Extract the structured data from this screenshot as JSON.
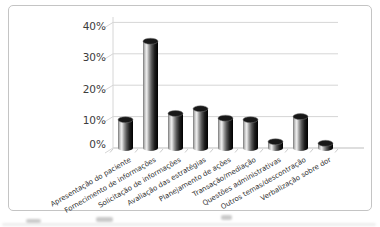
{
  "chart_data": {
    "type": "bar",
    "subtype": "3d-cylinder",
    "title": "",
    "xlabel": "",
    "ylabel": "",
    "categories": [
      "Apresentação do paciente",
      "Fornecimento de informações",
      "Solicitação de informações",
      "Avaliação das estratégias",
      "Planejamento de ações",
      "Transação/mediação",
      "Questões administrativas",
      "Outros temas/descontração",
      "Verbalização sobre dor"
    ],
    "values": [
      9,
      34,
      11,
      12.5,
      9.5,
      9,
      2,
      10,
      1.5
    ],
    "y_ticks": [
      "0%",
      "10%",
      "20%",
      "30%",
      "40%"
    ],
    "ylim": [
      0,
      40
    ],
    "grid": true,
    "legend": false,
    "colors": {
      "background": "#ffffff",
      "frame_border": "#c4c4c4",
      "gridline": "#d6d6d6",
      "axis": "#bdbdbd",
      "tick_text": "#3c3c3c",
      "category_text": "#333333",
      "bar_edge_left": "#777777",
      "bar_highlight": "#efefef",
      "bar_mid": "#555555",
      "bar_edge_right": "#000000",
      "bar_top": "#181818"
    }
  }
}
